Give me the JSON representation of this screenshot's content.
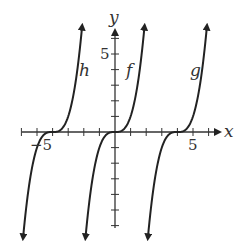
{
  "chart_data": {
    "type": "line",
    "title": "",
    "xlabel": "x",
    "ylabel": "y",
    "xlim": [
      -7,
      7
    ],
    "ylim": [
      -6.5,
      6.5
    ],
    "x_tick_labels": {
      "-5": "-5",
      "5": "5"
    },
    "y_tick_labels": {
      "5": "5"
    },
    "grid": false,
    "series": [
      {
        "name": "h",
        "formula": "(x+4)^3",
        "center": -4
      },
      {
        "name": "f",
        "formula": "x^3",
        "center": 0
      },
      {
        "name": "g",
        "formula": "(x-4)^3",
        "center": 4
      }
    ]
  },
  "labels": {
    "x_axis": "x",
    "y_axis": "y",
    "x_neg5": "−5",
    "x_pos5": "5",
    "y_pos5": "5",
    "h": "h",
    "f": "f",
    "g": "g"
  }
}
